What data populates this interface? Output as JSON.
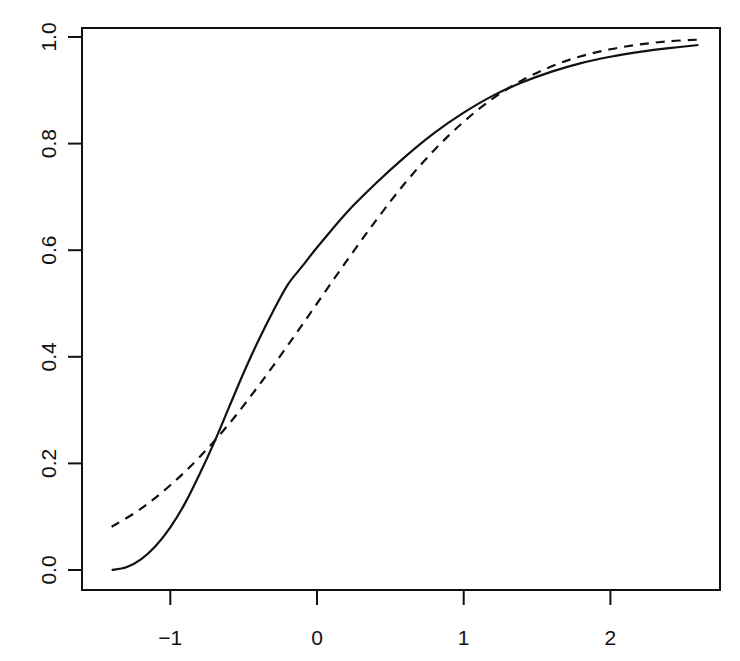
{
  "chart_data": {
    "type": "line",
    "title": "",
    "xlabel": "",
    "ylabel": "",
    "xlim": [
      -1.6,
      2.75
    ],
    "ylim": [
      -0.04,
      1.02
    ],
    "grid": false,
    "legend": null,
    "x_ticks": [
      -1,
      0,
      1,
      2
    ],
    "x_tick_labels": [
      "−1",
      "0",
      "1",
      "2"
    ],
    "y_ticks": [
      0.0,
      0.2,
      0.4,
      0.6,
      0.8,
      1.0
    ],
    "y_tick_labels": [
      "0.0",
      "0.2",
      "0.4",
      "0.6",
      "0.8",
      "1.0"
    ],
    "series": [
      {
        "name": "solid",
        "style": "solid",
        "color": "#111111",
        "x": [
          -1.4,
          -1.3,
          -1.2,
          -1.1,
          -1.0,
          -0.9,
          -0.8,
          -0.7,
          -0.6,
          -0.5,
          -0.4,
          -0.3,
          -0.2,
          -0.1,
          0.0,
          0.2,
          0.4,
          0.6,
          0.8,
          1.0,
          1.2,
          1.4,
          1.6,
          1.8,
          2.0,
          2.2,
          2.4,
          2.6
        ],
        "y": [
          0.0,
          0.005,
          0.02,
          0.045,
          0.08,
          0.125,
          0.18,
          0.24,
          0.305,
          0.37,
          0.43,
          0.485,
          0.535,
          0.57,
          0.605,
          0.67,
          0.725,
          0.775,
          0.82,
          0.858,
          0.89,
          0.915,
          0.935,
          0.951,
          0.963,
          0.972,
          0.979,
          0.985
        ]
      },
      {
        "name": "dashed",
        "style": "dashed",
        "color": "#111111",
        "x": [
          -1.4,
          -1.2,
          -1.0,
          -0.8,
          -0.6,
          -0.4,
          -0.2,
          0.0,
          0.2,
          0.4,
          0.6,
          0.8,
          1.0,
          1.2,
          1.4,
          1.6,
          1.8,
          2.0,
          2.2,
          2.4,
          2.6
        ],
        "y": [
          0.081,
          0.115,
          0.159,
          0.212,
          0.274,
          0.345,
          0.421,
          0.5,
          0.579,
          0.655,
          0.726,
          0.788,
          0.841,
          0.885,
          0.919,
          0.945,
          0.964,
          0.977,
          0.986,
          0.992,
          0.995
        ]
      }
    ]
  }
}
